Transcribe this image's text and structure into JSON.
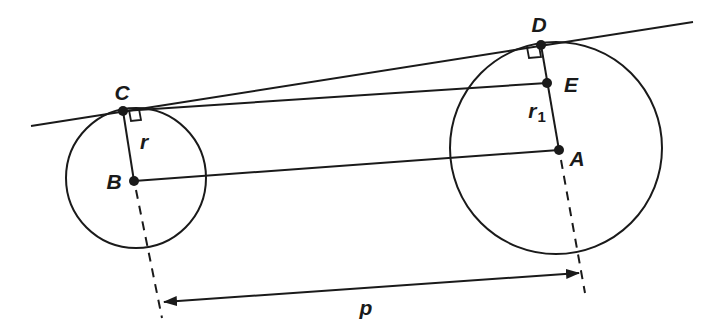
{
  "diagram": {
    "type": "geometry",
    "stroke_color": "#1a1a1a",
    "background": "#ffffff",
    "circles": [
      {
        "name": "small",
        "center": "B",
        "radius_label": "r"
      },
      {
        "name": "large",
        "center": "A",
        "radius_label": "r1"
      }
    ],
    "points": {
      "A": "A",
      "B": "B",
      "C": "C",
      "D": "D",
      "E": "E"
    },
    "labels": {
      "r": "r",
      "r1_main": "r",
      "r1_sub": "1",
      "p": "p"
    },
    "segments": [
      "CD (common tangent)",
      "CE",
      "BA",
      "BC (radius r)",
      "DA (radius r1)"
    ],
    "right_angles": [
      "C",
      "D"
    ],
    "dimension": {
      "label": "p",
      "between": [
        "B",
        "A"
      ],
      "arrows": "double"
    }
  }
}
